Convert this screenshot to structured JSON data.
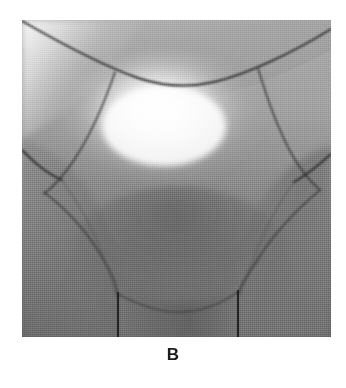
{
  "figure": {
    "caption": "B",
    "caption_position": "below-image",
    "panel": {
      "x": 22,
      "y": 20,
      "width": 309,
      "height": 317
    },
    "image_type": "grayscale-shaded-3d-surface-render",
    "colors": {
      "background": "#ffffff",
      "caption_text": "#1c1c1c",
      "surface_mid": "#8e8e8e",
      "surface_light": "#f2f2f2",
      "surface_highlight": "#ffffff",
      "surface_dark": "#5e5e5e",
      "surface_shadow": "#4a4a4a",
      "boundary_curve": "#2b2b2b",
      "boundary_curve_soft": "#555555"
    },
    "shading": {
      "specular_highlight_center_x": 143,
      "specular_highlight_center_y": 110,
      "highlight_radius": 95,
      "ambient_level": "medium-gray",
      "render_style": "dithered-halftone-gouraud"
    },
    "geometry_notes": {
      "top_arc_label": "upper trim arc spanning full panel width",
      "left_branch_label": "left tube boundary curve",
      "right_branch_label": "right tube boundary curve",
      "lower_branch_label": "lower tube with two straight silhouette edges",
      "junction_points": [
        {
          "name": "left-upper-junction",
          "x": 93,
          "y": 52
        },
        {
          "name": "right-upper-junction",
          "x": 236,
          "y": 48
        },
        {
          "name": "left-side-junction",
          "x": 40,
          "y": 153
        },
        {
          "name": "right-side-junction",
          "x": 274,
          "y": 158
        },
        {
          "name": "left-lower-junction",
          "x": 96,
          "y": 274
        },
        {
          "name": "right-lower-junction",
          "x": 216,
          "y": 271
        }
      ]
    }
  }
}
